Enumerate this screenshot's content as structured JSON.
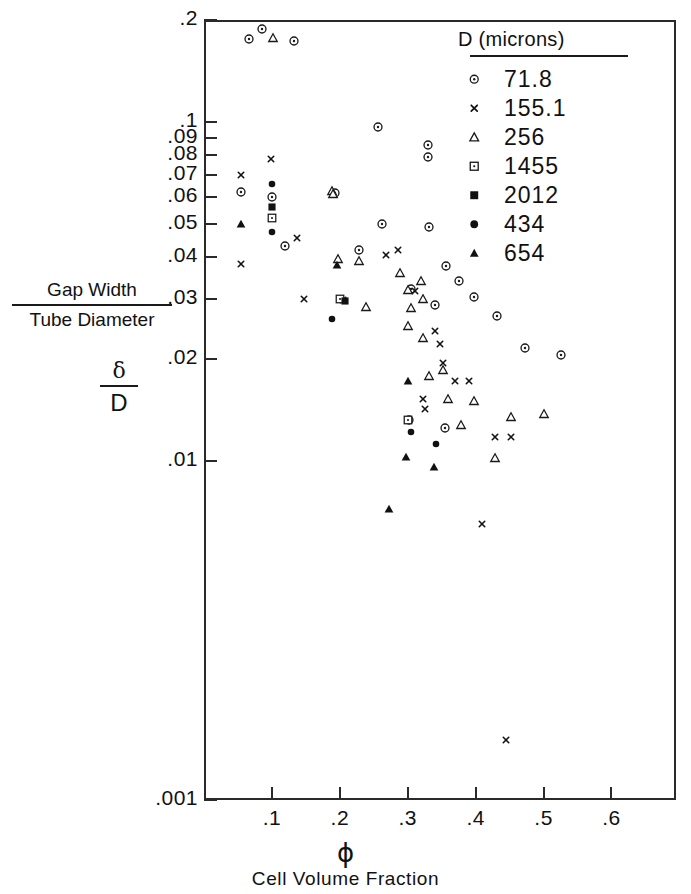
{
  "axes": {
    "y_title_numerator": "Gap Width",
    "y_title_denominator": "Tube Diameter",
    "y_symbol_numerator": "δ",
    "y_symbol_denominator": "D",
    "x_symbol": "ϕ",
    "x_title": "Cell Volume Fraction",
    "y_ticks": [
      ".2",
      ".1",
      ".09",
      ".08",
      ".07",
      ".06",
      ".05",
      ".04",
      ".03",
      ".02",
      ".01",
      ".001"
    ],
    "x_ticks": [
      ".1",
      ".2",
      ".3",
      ".4",
      ".5",
      ".6"
    ]
  },
  "legend": {
    "title": "D (microns)",
    "entries": [
      {
        "symbol": "open-circle-dot",
        "label": "71.8"
      },
      {
        "symbol": "cross",
        "label": "155.1"
      },
      {
        "symbol": "open-triangle",
        "label": "256"
      },
      {
        "symbol": "open-square-dot",
        "label": "1455"
      },
      {
        "symbol": "filled-square",
        "label": "2012"
      },
      {
        "symbol": "filled-circle",
        "label": "434"
      },
      {
        "symbol": "filled-triangle",
        "label": "654"
      }
    ]
  },
  "chart_data": {
    "type": "scatter",
    "title": "",
    "xlabel": "Cell Volume Fraction",
    "ylabel": "Gap Width / Tube Diameter",
    "xscale": "linear",
    "yscale": "log",
    "xlim": [
      0.0,
      0.695
    ],
    "ylim": [
      0.001,
      0.2
    ],
    "grid": false,
    "legend_position": "top-right",
    "legend_title": "D (microns)",
    "series": [
      {
        "name": "71.8",
        "symbol": "open-circle-dot",
        "points": [
          [
            0.066,
            0.176
          ],
          [
            0.086,
            0.188
          ],
          [
            0.132,
            0.174
          ],
          [
            0.055,
            0.062
          ],
          [
            0.1,
            0.06
          ],
          [
            0.193,
            0.0618
          ],
          [
            0.256,
            0.0965
          ],
          [
            0.33,
            0.0855
          ],
          [
            0.33,
            0.079
          ],
          [
            0.12,
            0.043
          ],
          [
            0.332,
            0.049
          ],
          [
            0.228,
            0.0418
          ],
          [
            0.262,
            0.05
          ],
          [
            0.356,
            0.0375
          ],
          [
            0.375,
            0.034
          ],
          [
            0.305,
            0.0322
          ],
          [
            0.34,
            0.0288
          ],
          [
            0.398,
            0.0305
          ],
          [
            0.432,
            0.0268
          ],
          [
            0.302,
            0.0132
          ],
          [
            0.355,
            0.0125
          ],
          [
            0.472,
            0.0215
          ],
          [
            0.525,
            0.0205
          ]
        ]
      },
      {
        "name": "155.1",
        "symbol": "cross",
        "points": [
          [
            0.055,
            0.07
          ],
          [
            0.098,
            0.078
          ],
          [
            0.055,
            0.038
          ],
          [
            0.137,
            0.0455
          ],
          [
            0.147,
            0.03
          ],
          [
            0.205,
            0.0298
          ],
          [
            0.268,
            0.0405
          ],
          [
            0.285,
            0.0418
          ],
          [
            0.31,
            0.0318
          ],
          [
            0.34,
            0.0242
          ],
          [
            0.348,
            0.0222
          ],
          [
            0.352,
            0.0195
          ],
          [
            0.322,
            0.0152
          ],
          [
            0.37,
            0.0172
          ],
          [
            0.39,
            0.0172
          ],
          [
            0.325,
            0.0142
          ],
          [
            0.428,
            0.0118
          ],
          [
            0.452,
            0.0118
          ],
          [
            0.41,
            0.0065
          ],
          [
            0.445,
            0.0015
          ]
        ]
      },
      {
        "name": "256",
        "symbol": "open-triangle",
        "points": [
          [
            0.102,
            0.1775
          ],
          [
            0.188,
            0.0625
          ],
          [
            0.19,
            0.0615
          ],
          [
            0.198,
            0.0395
          ],
          [
            0.228,
            0.039
          ],
          [
            0.238,
            0.0285
          ],
          [
            0.288,
            0.0358
          ],
          [
            0.3,
            0.032
          ],
          [
            0.32,
            0.034
          ],
          [
            0.305,
            0.0282
          ],
          [
            0.322,
            0.03
          ],
          [
            0.3,
            0.025
          ],
          [
            0.322,
            0.023
          ],
          [
            0.332,
            0.0178
          ],
          [
            0.352,
            0.0186
          ],
          [
            0.36,
            0.0152
          ],
          [
            0.378,
            0.0128
          ],
          [
            0.398,
            0.015
          ],
          [
            0.452,
            0.0135
          ],
          [
            0.428,
            0.0102
          ],
          [
            0.5,
            0.0138
          ]
        ]
      },
      {
        "name": "1455",
        "symbol": "open-square-dot",
        "points": [
          [
            0.1,
            0.052
          ],
          [
            0.2,
            0.03
          ],
          [
            0.3,
            0.0132
          ]
        ]
      },
      {
        "name": "2012",
        "symbol": "filled-square",
        "points": [
          [
            0.1,
            0.0562
          ],
          [
            0.208,
            0.0296
          ]
        ]
      },
      {
        "name": "434",
        "symbol": "filled-circle",
        "points": [
          [
            0.1,
            0.0655
          ],
          [
            0.1,
            0.0475
          ],
          [
            0.188,
            0.0262
          ],
          [
            0.305,
            0.0122
          ],
          [
            0.342,
            0.0112
          ]
        ]
      },
      {
        "name": "654",
        "symbol": "filled-triangle",
        "points": [
          [
            0.055,
            0.05
          ],
          [
            0.196,
            0.0378
          ],
          [
            0.3,
            0.0172
          ],
          [
            0.298,
            0.0103
          ],
          [
            0.338,
            0.0096
          ],
          [
            0.272,
            0.0072
          ]
        ]
      }
    ]
  }
}
